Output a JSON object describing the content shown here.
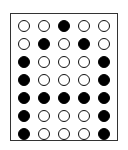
{
  "diagram": {
    "type": "dot-matrix",
    "character": "A",
    "columns": 5,
    "rows": 7,
    "colors": {
      "on": "#000000",
      "off": "#ffffff",
      "outline": "#111111",
      "border": "#333333"
    },
    "matrix": [
      [
        0,
        0,
        1,
        0,
        0
      ],
      [
        0,
        1,
        0,
        1,
        0
      ],
      [
        1,
        0,
        0,
        0,
        1
      ],
      [
        1,
        0,
        0,
        0,
        1
      ],
      [
        1,
        1,
        1,
        1,
        1
      ],
      [
        1,
        0,
        0,
        0,
        1
      ],
      [
        1,
        0,
        0,
        0,
        1
      ]
    ]
  }
}
